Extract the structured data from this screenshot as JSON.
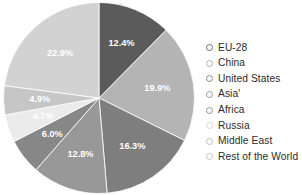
{
  "chart_data": {
    "type": "pie",
    "title": "",
    "categories": [
      "EU-28",
      "China",
      "United States",
      "Asia'",
      "Africa",
      "Russia",
      "Middle East",
      "Rest of the World"
    ],
    "values": [
      12.4,
      19.9,
      16.3,
      12.8,
      6.0,
      4.7,
      4.9,
      22.9
    ],
    "value_labels": [
      "12.4%",
      "19.9%",
      "16.3%",
      "12.8%",
      "6.0%",
      "4.7%",
      "4.9%",
      "22.9%"
    ],
    "slice_colors": [
      "#5b5b5b",
      "#b4b4b4",
      "#7e7e7e",
      "#989898",
      "#878787",
      "#ebebeb",
      "#c6c6c6",
      "#d2d2d2"
    ],
    "label_colors": [
      "#ffffff",
      "#ffffff",
      "#ffffff",
      "#ffffff",
      "#ffffff",
      "#ffffff",
      "#ffffff",
      "#ffffff"
    ],
    "start_angle_deg": 0,
    "direction": "clockwise",
    "legend_position": "right",
    "grid": false,
    "xlabel": "",
    "ylabel": ""
  },
  "legend": {
    "items": [
      {
        "label": "EU-28",
        "marker_color": "#ffffff",
        "marker_border": "#6e6e6e"
      },
      {
        "label": "China",
        "marker_color": "#ffffff",
        "marker_border": "#b0b0b0"
      },
      {
        "label": "United States",
        "marker_color": "#ffffff",
        "marker_border": "#8a8a8a"
      },
      {
        "label": "Asia'",
        "marker_color": "#ffffff",
        "marker_border": "#9a9a9a"
      },
      {
        "label": "Africa",
        "marker_color": "#ffffff",
        "marker_border": "#8f8f8f"
      },
      {
        "label": "Russia",
        "marker_color": "#ffffff",
        "marker_border": "#d8d8d8"
      },
      {
        "label": "Middle East",
        "marker_color": "#ffffff",
        "marker_border": "#bcbcbc"
      },
      {
        "label": "Rest of the World",
        "marker_color": "#ffffff",
        "marker_border": "#c4c4c4"
      }
    ]
  }
}
